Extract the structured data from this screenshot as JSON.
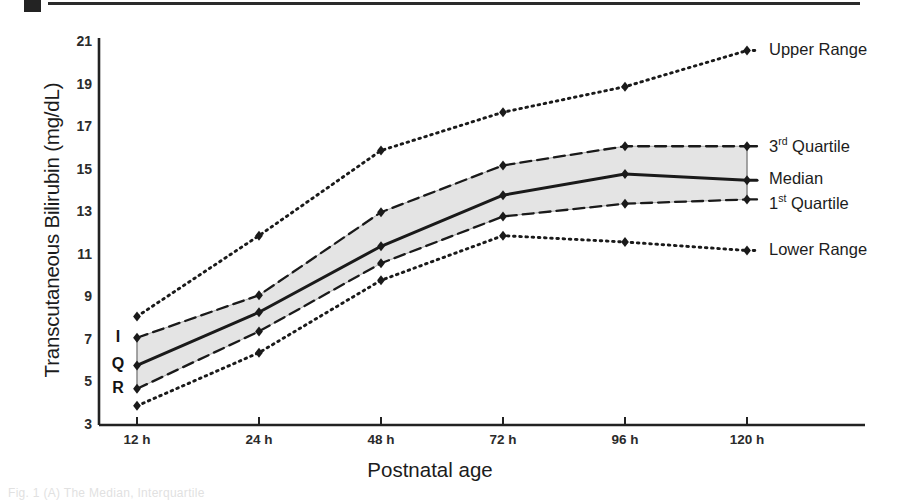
{
  "figure": {
    "caption_fragment": "Fig. 1  (A)  The Median, Interquartile"
  },
  "axes": {
    "y_title": "Transcutaneous Bilirubin (mg/dL)",
    "x_title": "Postnatal age",
    "y_ticks": [
      "3",
      "5",
      "7",
      "9",
      "11",
      "13",
      "15",
      "17",
      "19",
      "21"
    ],
    "x_ticks": [
      "12 h",
      "24 h",
      "48 h",
      "72 h",
      "96 h",
      "120 h"
    ]
  },
  "annotations": {
    "iqr_letters": [
      "I",
      "Q",
      "R"
    ]
  },
  "legend": {
    "upper_range": "Upper Range",
    "third_quartile_main": "3",
    "third_quartile_sup": "rd",
    "third_quartile_rest": " Quartile",
    "median": "Median",
    "first_quartile_main": "1",
    "first_quartile_sup": "st",
    "first_quartile_rest": " Quartile",
    "lower_range": "Lower Range"
  },
  "colors": {
    "line": "#1a1a1a",
    "band_fill": "#e4e4e4",
    "axis": "#222222",
    "text": "#1c1c1c"
  },
  "chart_data": {
    "type": "line",
    "title": "",
    "xlabel": "Postnatal age",
    "ylabel": "Transcutaneous Bilirubin (mg/dL)",
    "categories": [
      "12 h",
      "24 h",
      "48 h",
      "72 h",
      "96 h",
      "120 h"
    ],
    "ylim": [
      3,
      21
    ],
    "ytick_step": 2,
    "grid": false,
    "legend_position": "right-outside",
    "series": [
      {
        "name": "Upper Range",
        "style": "dotted",
        "marker": "diamond",
        "values": [
          8.1,
          11.9,
          15.9,
          17.7,
          18.9,
          20.6
        ]
      },
      {
        "name": "3rd Quartile",
        "style": "dashed",
        "marker": "diamond",
        "values": [
          7.1,
          9.1,
          13.0,
          15.2,
          16.1,
          16.1
        ]
      },
      {
        "name": "Median",
        "style": "solid",
        "marker": "diamond",
        "values": [
          5.8,
          8.3,
          11.4,
          13.8,
          14.8,
          14.5
        ]
      },
      {
        "name": "1st Quartile",
        "style": "dashed",
        "marker": "diamond",
        "values": [
          4.7,
          7.4,
          10.6,
          12.8,
          13.4,
          13.6
        ]
      },
      {
        "name": "Lower Range",
        "style": "dotted",
        "marker": "diamond",
        "values": [
          3.9,
          6.4,
          9.8,
          11.9,
          11.6,
          11.2
        ]
      }
    ],
    "shaded_band": {
      "between": [
        "1st Quartile",
        "3rd Quartile"
      ],
      "label": "IQR"
    }
  }
}
